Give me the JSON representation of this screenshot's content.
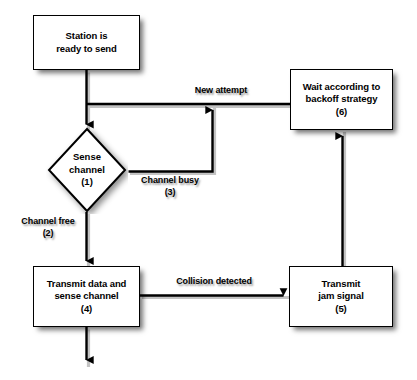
{
  "diagram": {
    "background_color": "#ffffff",
    "stroke_color": "#000000",
    "node_fill": "#ffffff",
    "nodes": [
      {
        "id": "station-ready",
        "shape": "rect",
        "label": "Station is\nready to send",
        "step": ""
      },
      {
        "id": "sense-channel",
        "shape": "diamond",
        "label": "Sense\nchannel\n(1)",
        "step": "(1)"
      },
      {
        "id": "wait-backoff",
        "shape": "rect",
        "label": "Wait according to\nbackoff strategy\n(6)",
        "step": "(6)"
      },
      {
        "id": "transmit-data",
        "shape": "rect",
        "label": "Transmit data and\nsense channel\n(4)",
        "step": "(4)"
      },
      {
        "id": "transmit-jam",
        "shape": "rect",
        "label": "Transmit\njam signal\n(5)",
        "step": "(5)"
      }
    ],
    "edge_labels": [
      {
        "id": "new-attempt",
        "text": "New attempt"
      },
      {
        "id": "channel-busy",
        "text": "Channel busy\n(3)"
      },
      {
        "id": "channel-free",
        "text": "Channel free\n(2)"
      },
      {
        "id": "collision-detected",
        "text": "Collision detected"
      }
    ]
  }
}
